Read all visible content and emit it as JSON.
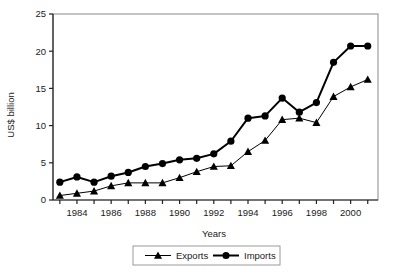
{
  "chart_data": {
    "type": "line",
    "title": "",
    "xlabel": "Years",
    "ylabel": "US$ billion",
    "x": [
      1983,
      1984,
      1985,
      1986,
      1987,
      1988,
      1989,
      1990,
      1991,
      1992,
      1993,
      1994,
      1995,
      1996,
      1997,
      1998,
      1999,
      2000,
      2001
    ],
    "xlim": [
      1982.6,
      2001.6
    ],
    "ylim": [
      0,
      25
    ],
    "yticks": [
      0,
      5,
      10,
      15,
      20,
      25
    ],
    "xticks": [
      1983,
      1984,
      1985,
      1986,
      1987,
      1988,
      1989,
      1990,
      1991,
      1992,
      1993,
      1994,
      1995,
      1996,
      1997,
      1998,
      1999,
      2000,
      2001
    ],
    "xtick_labels": [
      "",
      "1984",
      "",
      "1986",
      "",
      "1988",
      "",
      "1990",
      "",
      "1992",
      "",
      "1994",
      "",
      "1996",
      "",
      "1998",
      "",
      "2000",
      ""
    ],
    "grid": false,
    "legend_position": "bottom",
    "series": [
      {
        "name": "Exports",
        "marker": "triangle",
        "color": "#000000",
        "line_width": 1,
        "values": [
          0.6,
          0.9,
          1.2,
          1.9,
          2.3,
          2.3,
          2.3,
          3.0,
          3.8,
          4.5,
          4.6,
          6.5,
          8.0,
          10.8,
          11.0,
          10.4,
          13.9,
          15.2,
          16.2
        ]
      },
      {
        "name": "Imports",
        "marker": "circle",
        "color": "#000000",
        "line_width": 2,
        "values": [
          2.4,
          3.1,
          2.4,
          3.2,
          3.7,
          4.5,
          4.9,
          5.4,
          5.6,
          6.2,
          7.9,
          11.0,
          11.3,
          13.7,
          11.8,
          13.1,
          18.5,
          20.7,
          20.7
        ]
      }
    ]
  },
  "legend": {
    "items": [
      {
        "label": "Exports",
        "marker": "triangle"
      },
      {
        "label": "Imports",
        "marker": "circle"
      }
    ]
  }
}
